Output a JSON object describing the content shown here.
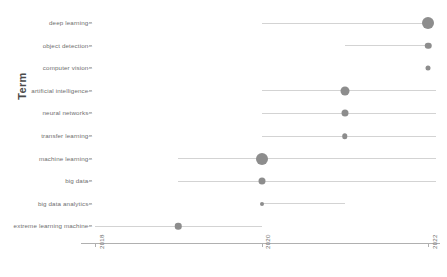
{
  "chart_data": {
    "type": "scatter",
    "title": "",
    "xlabel": "",
    "ylabel": "Term",
    "xlim": [
      2018,
      2022
    ],
    "xticks": [
      "2018",
      "2020",
      "2022"
    ],
    "grid": false,
    "legend": false,
    "series_note": "Dumbbell / lollipop chart: each term has a year range line and a sized dot at its peak year; dot size encodes magnitude.",
    "categories": [
      "deep learning",
      "object detection",
      "computer vision",
      "artificial intelligence",
      "neural networks",
      "transfer learning",
      "machine learning",
      "big data",
      "big data analytics",
      "extreme learning machine"
    ],
    "points": [
      {
        "term": "deep learning",
        "peak_year": 2022.0,
        "range_start": 2020.0,
        "range_end": 2022.0,
        "size": 12.0
      },
      {
        "term": "object detection",
        "peak_year": 2022.0,
        "range_start": 2021.0,
        "range_end": 2022.0,
        "size": 6.5
      },
      {
        "term": "computer vision",
        "peak_year": 2022.0,
        "range_start": 2022.0,
        "range_end": 2022.0,
        "size": 5.0
      },
      {
        "term": "artificial intelligence",
        "peak_year": 2021.0,
        "range_start": 2020.0,
        "range_end": 2022.1,
        "size": 9.0
      },
      {
        "term": "neural networks",
        "peak_year": 2021.0,
        "range_start": 2020.0,
        "range_end": 2022.1,
        "size": 7.0
      },
      {
        "term": "transfer learning",
        "peak_year": 2021.0,
        "range_start": 2020.0,
        "range_end": 2022.1,
        "size": 5.5
      },
      {
        "term": "machine learning",
        "peak_year": 2020.0,
        "range_start": 2019.0,
        "range_end": 2022.1,
        "size": 12.0
      },
      {
        "term": "big data",
        "peak_year": 2020.0,
        "range_start": 2019.0,
        "range_end": 2022.1,
        "size": 7.0
      },
      {
        "term": "big data analytics",
        "peak_year": 2020.0,
        "range_start": 2020.0,
        "range_end": 2021.0,
        "size": 4.0
      },
      {
        "term": "extreme learning machine",
        "peak_year": 2019.0,
        "range_start": 2018.0,
        "range_end": 2020.0,
        "size": 6.5
      }
    ],
    "colors": {
      "dot": "#8d8d8d",
      "line": "#d3d3d3",
      "axis": "#b0b0b0",
      "text": "#6e6e6e"
    }
  }
}
